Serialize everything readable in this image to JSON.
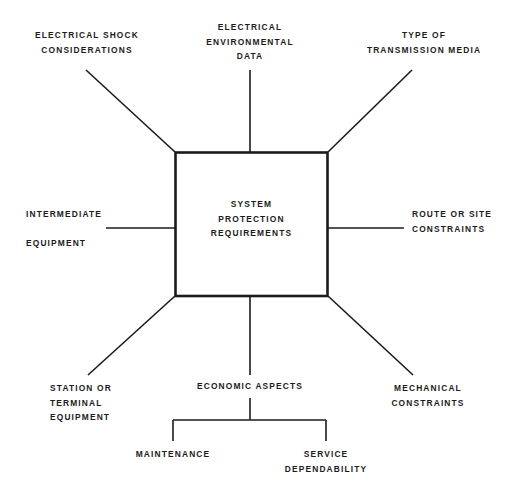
{
  "diagram": {
    "type": "radial-fishbone",
    "center": {
      "id": "system-protection-requirements",
      "label": "SYSTEM\nPROTECTION\nREQUIREMENTS"
    },
    "branches": [
      {
        "id": "electrical-shock-considerations",
        "label": "ELECTRICAL SHOCK\nCONSIDERATIONS",
        "position": "top-left"
      },
      {
        "id": "electrical-environmental-data",
        "label": "ELECTRICAL\nENVIRONMENTAL\nDATA",
        "position": "top-center"
      },
      {
        "id": "type-of-transmission-media",
        "label": "TYPE OF\nTRANSMISSION MEDIA",
        "position": "top-right"
      },
      {
        "id": "intermediate-equipment",
        "label": "INTERMEDIATE\n\nEQUIPMENT",
        "position": "left-middle"
      },
      {
        "id": "route-or-site-constraints",
        "label": "ROUTE OR SITE\nCONSTRAINTS",
        "position": "right-middle"
      },
      {
        "id": "station-or-terminal-equipment",
        "label": "STATION OR\nTERMINAL\nEQUIPMENT",
        "position": "bottom-left"
      },
      {
        "id": "economic-aspects",
        "label": "ECONOMIC ASPECTS",
        "position": "bottom-center"
      },
      {
        "id": "mechanical-constraints",
        "label": "MECHANICAL\nCONSTRAINTS",
        "position": "bottom-right"
      }
    ],
    "sub_branches": [
      {
        "id": "maintenance",
        "label": "MAINTENANCE",
        "parent": "economic-aspects"
      },
      {
        "id": "service-dependability",
        "label": "SERVICE\nDEPENDABILITY",
        "parent": "economic-aspects"
      }
    ],
    "colors": {
      "background": "#ffffff",
      "line": "#1b1b1b",
      "text": "#1b1b1b"
    }
  }
}
